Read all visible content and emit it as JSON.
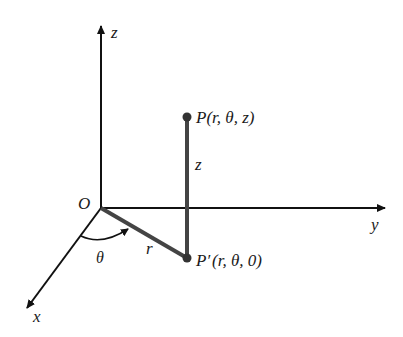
{
  "diagram": {
    "axes": {
      "x_label": "x",
      "y_label": "y",
      "z_label": "z",
      "origin_label": "O"
    },
    "points": {
      "P": {
        "name": "P",
        "coords": "(r, θ, z)"
      },
      "P_prime": {
        "name": "P′",
        "coords": "(r, θ, 0)"
      }
    },
    "segments": {
      "r_label": "r",
      "z_label": "z",
      "theta_label": "θ"
    },
    "colors": {
      "axis": "#111111",
      "segment": "#444444",
      "text": "#1a1a1a"
    }
  }
}
